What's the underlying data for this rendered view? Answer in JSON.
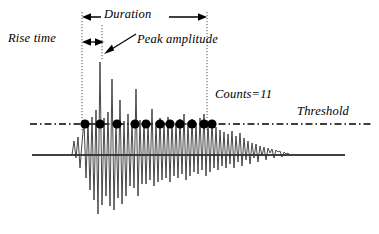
{
  "figure": {
    "background_color": "#ffffff",
    "stroke_color": "#000000",
    "width": 379,
    "height": 234
  },
  "labels": {
    "rise_time": "Rise time",
    "duration": "Duration",
    "peak_amplitude": "Peak amplitude",
    "counts": "Counts=11",
    "threshold": "Threshold"
  },
  "chart_data": {
    "type": "line",
    "xlabel": "",
    "ylabel": "",
    "grid": false,
    "legend": null,
    "annotations": [
      {
        "name": "rise-time",
        "label": "Rise time",
        "type": "double-arrow",
        "from_x": 82,
        "to_x": 104,
        "y": 42
      },
      {
        "name": "duration",
        "label": "Duration",
        "type": "double-arrow",
        "from_x": 82,
        "to_x": 207,
        "y": 17
      },
      {
        "name": "peak-amplitude",
        "label": "Peak amplitude",
        "type": "pointer-arrow",
        "from_x": 136,
        "from_y": 34,
        "to_x": 105,
        "to_y": 53
      },
      {
        "name": "counts",
        "label": "Counts=11",
        "type": "text",
        "x": 215,
        "y": 96
      },
      {
        "name": "threshold",
        "label": "Threshold",
        "type": "text",
        "x": 297,
        "y": 113
      }
    ],
    "guide_lines": [
      {
        "name": "signal-start-guide",
        "orientation": "vertical",
        "x": 82,
        "y_from": 12,
        "y_to": 131,
        "style": "dotted"
      },
      {
        "name": "peak-guide",
        "orientation": "vertical",
        "x": 102,
        "y_from": 22,
        "y_to": 60,
        "style": "dotted"
      },
      {
        "name": "signal-end-guide",
        "orientation": "vertical",
        "x": 207,
        "y_from": 12,
        "y_to": 130,
        "style": "dotted"
      },
      {
        "name": "threshold-line",
        "orientation": "horizontal",
        "y": 124,
        "x_from": 30,
        "x_to": 371,
        "style": "dash-dot"
      },
      {
        "name": "baseline",
        "orientation": "horizontal",
        "y": 155,
        "x_from": 32,
        "x_to": 345,
        "style": "solid"
      }
    ],
    "threshold_level": 124,
    "baseline_level": 155,
    "counts_value": 11,
    "count_markers_x": [
      85,
      100,
      117,
      135,
      146,
      160,
      170,
      180,
      192,
      204,
      212
    ],
    "count_marker_y": 124,
    "count_marker_radius": 4.6,
    "waveform_x": [
      72,
      74,
      76,
      78,
      80,
      82,
      84,
      86,
      88,
      90,
      92,
      94,
      96,
      98,
      100,
      102,
      104,
      106,
      108,
      110,
      112,
      114,
      116,
      118,
      120,
      122,
      124,
      126,
      128,
      130,
      132,
      134,
      136,
      138,
      140,
      142,
      144,
      146,
      148,
      150,
      152,
      154,
      156,
      158,
      160,
      162,
      164,
      166,
      168,
      170,
      172,
      174,
      176,
      178,
      180,
      182,
      184,
      186,
      188,
      190,
      192,
      194,
      196,
      198,
      200,
      202,
      204,
      206,
      208,
      210,
      212,
      214,
      216,
      218,
      220,
      222,
      224,
      226,
      228,
      230,
      232,
      234,
      236,
      238,
      240,
      242,
      244,
      246,
      248,
      250,
      252,
      254,
      256,
      258,
      260,
      262,
      264,
      266,
      268,
      270,
      272,
      274,
      276,
      278,
      280,
      282,
      284,
      286,
      288,
      290
    ],
    "waveform_y": [
      155,
      141,
      158,
      137,
      168,
      143,
      121,
      178,
      122,
      190,
      117,
      200,
      110,
      214,
      62,
      205,
      118,
      196,
      112,
      206,
      79,
      210,
      120,
      198,
      100,
      204,
      121,
      196,
      114,
      186,
      122,
      188,
      89,
      196,
      120,
      184,
      120,
      184,
      123,
      180,
      109,
      186,
      122,
      182,
      118,
      180,
      122,
      178,
      117,
      182,
      121,
      176,
      123,
      178,
      119,
      174,
      114,
      180,
      122,
      176,
      119,
      172,
      123,
      174,
      118,
      170,
      114,
      176,
      121,
      172,
      121,
      168,
      127,
      170,
      130,
      166,
      132,
      168,
      134,
      164,
      131,
      168,
      136,
      162,
      133,
      166,
      138,
      160,
      141,
      164,
      143,
      158,
      144,
      162,
      146,
      156,
      147,
      160,
      148,
      153,
      149,
      158,
      150,
      152,
      151,
      157,
      152,
      154,
      153,
      156,
      154,
      155
    ]
  }
}
